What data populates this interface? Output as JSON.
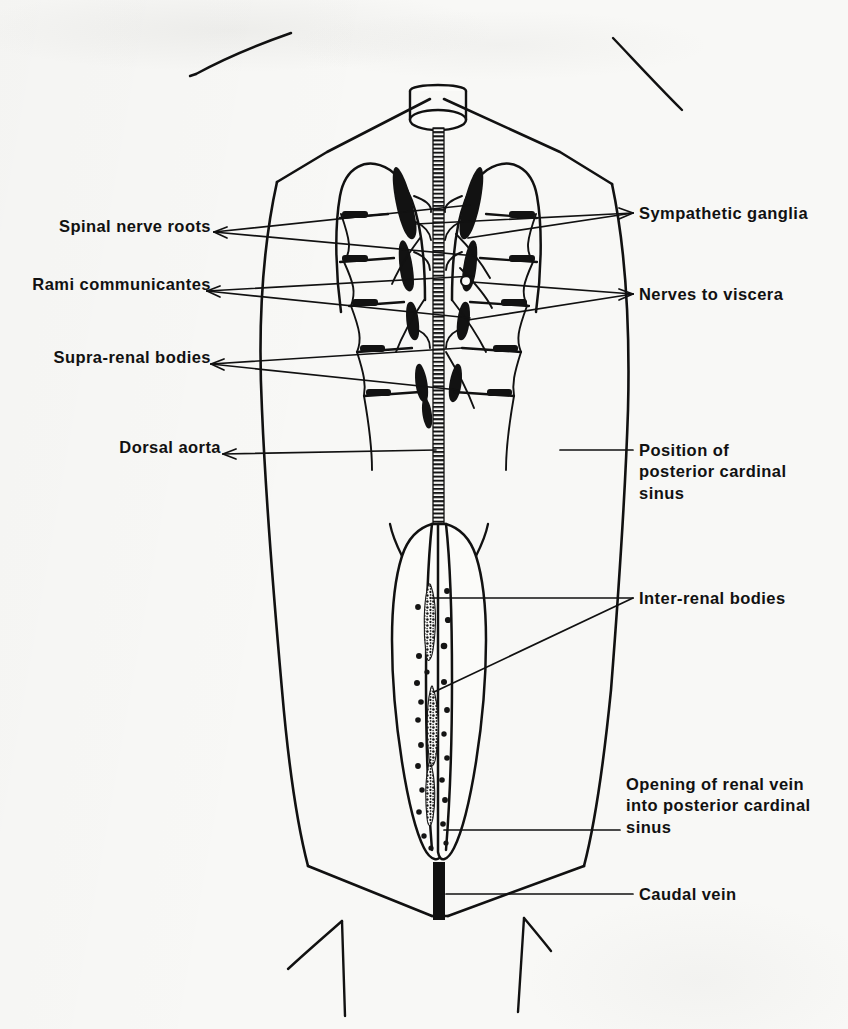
{
  "figure": {
    "kind": "anatomical-line-drawing",
    "background_color": "#f8f8f6",
    "ink_color": "#111111"
  },
  "labels_left": [
    {
      "id": "spinal-nerve-roots",
      "text": "Spinal nerve roots",
      "x": 33,
      "y": 227
    },
    {
      "id": "rami-communicantes",
      "text": "Rami communicantes",
      "x": 13,
      "y": 285
    },
    {
      "id": "supra-renal-bodies",
      "text": "Supra-renal bodies",
      "x": 20,
      "y": 358
    },
    {
      "id": "dorsal-aorta",
      "text": "Dorsal aorta",
      "x": 121,
      "y": 447
    }
  ],
  "labels_right": [
    {
      "id": "sympathetic-ganglia",
      "text": "Sympathetic ganglia",
      "x": 639,
      "y": 207
    },
    {
      "id": "nerves-to-viscera",
      "text": "Nerves to viscera",
      "x": 639,
      "y": 288
    },
    {
      "id": "position-of-posterior-cardinal-sinus",
      "text": "Position of\nposterior cardinal\nsinus",
      "x": 639,
      "y": 444
    },
    {
      "id": "inter-renal-bodies",
      "text": "Inter-renal bodies",
      "x": 639,
      "y": 592
    },
    {
      "id": "opening-of-renal-vein",
      "text": "Opening of renal vein\ninto posterior cardinal\nsinus",
      "x": 626,
      "y": 778
    },
    {
      "id": "caudal-vein",
      "text": "Caudal vein",
      "x": 639,
      "y": 888
    }
  ]
}
